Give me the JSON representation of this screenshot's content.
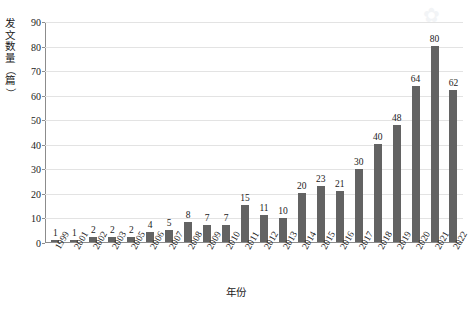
{
  "chart_data": {
    "type": "bar",
    "title": "",
    "xlabel": "年份",
    "ylabel": "发文数量（篇）",
    "categories": [
      "1999",
      "2001",
      "2002",
      "2003",
      "2005",
      "2006",
      "2007",
      "2008",
      "2009",
      "2010",
      "2011",
      "2012",
      "2013",
      "2014",
      "2015",
      "2016",
      "2017",
      "2018",
      "2019",
      "2020",
      "2021",
      "2022"
    ],
    "values": [
      1,
      1,
      2,
      2,
      2,
      4,
      5,
      8,
      7,
      7,
      15,
      11,
      10,
      20,
      23,
      21,
      30,
      40,
      48,
      64,
      80,
      62
    ],
    "ylim": [
      0,
      90
    ],
    "yticks": [
      0,
      10,
      20,
      30,
      40,
      50,
      60,
      70,
      80,
      90
    ],
    "grid": true,
    "legend": false,
    "legend_position": "none",
    "bar_color": "#636363",
    "grid_color": "#e3e3e3",
    "axis_color": "#8c8c8c",
    "text_color": "#1a1a1a",
    "data_labels": true
  },
  "axes": {
    "y_title_chars": [
      "发",
      "文",
      "数",
      "量",
      "（",
      "篇",
      "）"
    ],
    "x_title": "年份"
  },
  "watermark": {
    "glyph": "✿"
  }
}
